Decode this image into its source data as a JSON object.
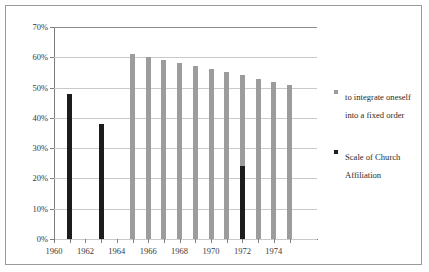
{
  "chart_data": {
    "type": "bar",
    "title": "",
    "xlabel": "",
    "ylabel": "",
    "ylim": [
      0,
      70
    ],
    "grid": true,
    "legend_position": "right",
    "x": [
      1960,
      1961,
      1962,
      1963,
      1964,
      1965,
      1966,
      1967,
      1968,
      1969,
      1970,
      1971,
      1972,
      1973,
      1974,
      1975
    ],
    "xtick_labels": [
      "1960",
      "1962",
      "1964",
      "1966",
      "1968",
      "1970",
      "1972",
      "1974"
    ],
    "ytick_labels": [
      "0%",
      "10%",
      "20%",
      "30%",
      "40%",
      "50%",
      "60%",
      "70%"
    ],
    "ytick_values": [
      0,
      10,
      20,
      30,
      40,
      50,
      60,
      70
    ],
    "series": [
      {
        "name": "to integrate oneself into a fixed order",
        "color": "#9c9c9c",
        "points": [
          {
            "year": 1965,
            "value": 61
          },
          {
            "year": 1966,
            "value": 60
          },
          {
            "year": 1967,
            "value": 59
          },
          {
            "year": 1968,
            "value": 58
          },
          {
            "year": 1969,
            "value": 57
          },
          {
            "year": 1970,
            "value": 56
          },
          {
            "year": 1971,
            "value": 55
          },
          {
            "year": 1972,
            "value": 54
          },
          {
            "year": 1973,
            "value": 53
          },
          {
            "year": 1974,
            "value": 52
          },
          {
            "year": 1975,
            "value": 51
          }
        ]
      },
      {
        "name": "Scale of Church Affiliation",
        "color": "#1c1c1c",
        "points": [
          {
            "year": 1961,
            "value": 48
          },
          {
            "year": 1963,
            "value": 38
          },
          {
            "year": 1972,
            "value": 24
          }
        ]
      }
    ]
  },
  "legend": {
    "entries": [
      {
        "label": "to integrate oneself into a fixed order",
        "color": "#9c9c9c",
        "swatch": "gray"
      },
      {
        "label": "Scale of Church Affiliation",
        "color": "#1c1c1c",
        "swatch": "black"
      }
    ]
  }
}
